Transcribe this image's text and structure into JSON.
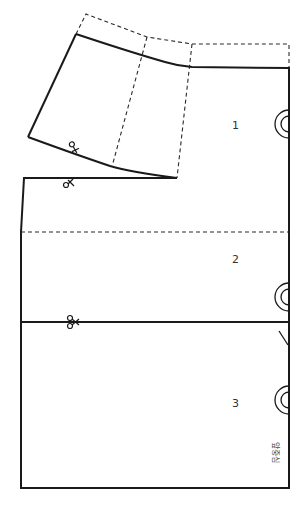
{
  "diagram": {
    "sections": [
      {
        "label": "1"
      },
      {
        "label": "2"
      },
      {
        "label": "3"
      }
    ],
    "front_center_label": "앞중심",
    "symbols": {
      "scissors": "scissors-icon",
      "grain_circle": "double-circle-icon",
      "notch": "notch-mark"
    },
    "colors": {
      "line": "#1a1a1a",
      "background": "#ffffff"
    }
  }
}
